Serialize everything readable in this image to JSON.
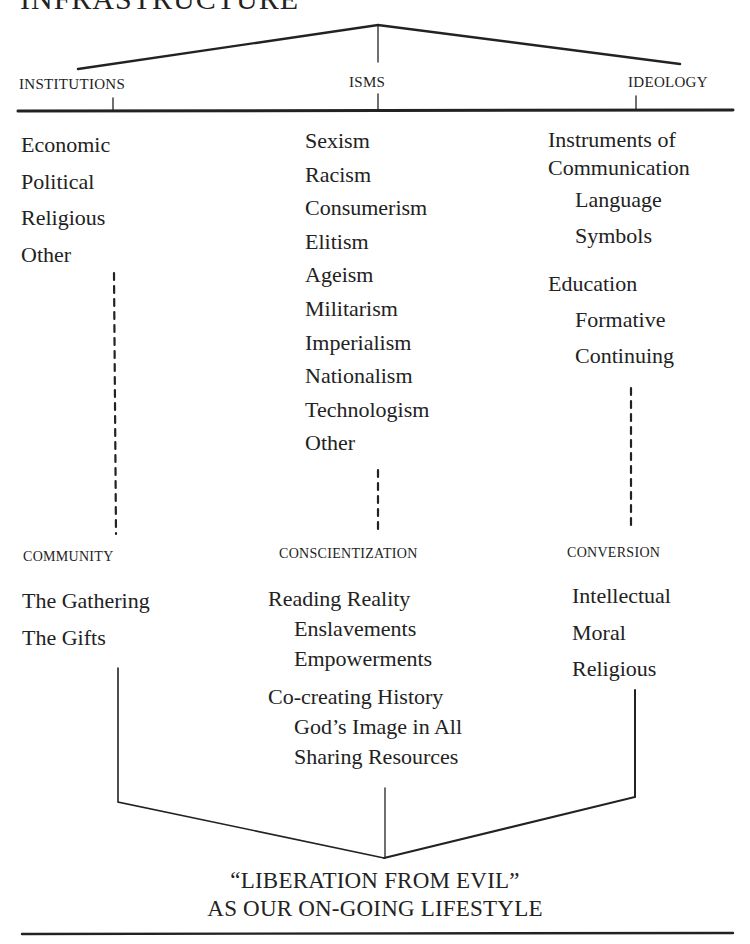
{
  "title_partial": "INFRASTRUCTURE",
  "top_headers": {
    "institutions": "INSTITUTIONS",
    "isms": "ISMS",
    "ideology": "IDEOLOGY"
  },
  "institutions": {
    "items": [
      "Economic",
      "Political",
      "Religious",
      "Other"
    ]
  },
  "isms": {
    "items": [
      "Sexism",
      "Racism",
      "Consumerism",
      "Elitism",
      "Ageism",
      "Militarism",
      "Imperialism",
      "Nationalism",
      "Technologism",
      "Other"
    ]
  },
  "ideology": {
    "group1": {
      "heading": [
        "Instruments of",
        "Communication"
      ],
      "subitems": [
        "Language",
        "Symbols"
      ]
    },
    "group2": {
      "heading": "Education",
      "subitems": [
        "Formative",
        "Continuing"
      ]
    }
  },
  "bottom_headers": {
    "community": "COMMUNITY",
    "conscientization": "CONSCIENTIZATION",
    "conversion": "CONVERSION"
  },
  "community": {
    "items": [
      "The Gathering",
      "The Gifts"
    ]
  },
  "conscientization": {
    "group1": {
      "heading": "Reading Reality",
      "subitems": [
        "Enslavements",
        "Empowerments"
      ]
    },
    "group2": {
      "heading": "Co-creating History",
      "subitems": [
        "God’s Image in All",
        "Sharing Resources"
      ]
    }
  },
  "conversion": {
    "items": [
      "Intellectual",
      "Moral",
      "Religious"
    ]
  },
  "footer": {
    "line1": "“LIBERATION FROM EVIL”",
    "line2": "AS OUR ON-GOING LIFESTYLE"
  }
}
